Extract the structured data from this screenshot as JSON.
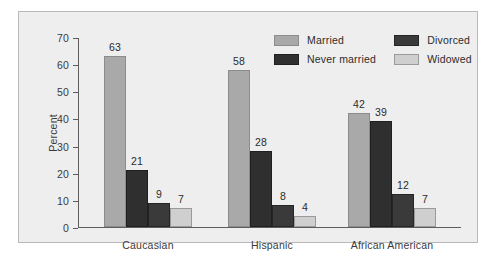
{
  "chart_data": {
    "type": "bar",
    "title": "",
    "xlabel": "",
    "ylabel": "Percent",
    "ylim": [
      0,
      70
    ],
    "yticks": [
      0,
      10,
      20,
      30,
      40,
      50,
      60,
      70
    ],
    "ytick_labels": [
      "0",
      "10",
      "20",
      "30",
      "40",
      "50",
      "60",
      "70"
    ],
    "grid": false,
    "legend_position": "top-right",
    "categories": [
      "Caucasian",
      "Hispanic",
      "African American"
    ],
    "series": [
      {
        "name": "Married",
        "color": "#a9a9a9",
        "values": [
          63,
          58,
          42
        ]
      },
      {
        "name": "Never married",
        "color": "#2f2f2f",
        "values": [
          21,
          28,
          39
        ]
      },
      {
        "name": "Divorced",
        "color": "#3a3a3a",
        "values": [
          9,
          8,
          12
        ]
      },
      {
        "name": "Widowed",
        "color": "#cfcfcf",
        "values": [
          7,
          4,
          7
        ]
      }
    ],
    "value_labels": [
      [
        "63",
        "21",
        "9",
        "7"
      ],
      [
        "58",
        "28",
        "8",
        "4"
      ],
      [
        "42",
        "39",
        "12",
        "7"
      ]
    ],
    "legend_order": [
      "Married",
      "Divorced",
      "Never married",
      "Widowed"
    ]
  },
  "figure": {
    "background_color": "#eeeeee",
    "border_color": "#b9b9b9",
    "axis_color": "#5d5d5d",
    "text_color": "#2c2c2c"
  }
}
